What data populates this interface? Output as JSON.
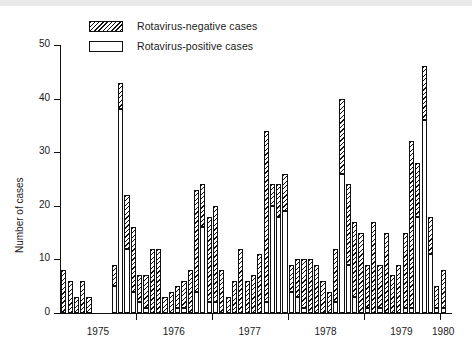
{
  "figure": {
    "ylabel": "Number of cases",
    "y_ticks": [
      "0",
      "10",
      "20",
      "30",
      "40",
      "50"
    ],
    "x_ticks": [
      "1975",
      "1976",
      "1977",
      "1978",
      "1979",
      "1980"
    ],
    "legend": [
      {
        "key": "negative",
        "label": "Rotavirus-negative cases",
        "swatch": "hatched"
      },
      {
        "key": "positive",
        "label": "Rotavirus-positive cases",
        "swatch": "white"
      }
    ],
    "colors": {
      "axis": "#111111",
      "hatch": "#111111",
      "positive_fill": "#ffffff",
      "background": "#ffffff"
    }
  },
  "chart_data": {
    "type": "bar",
    "title": "",
    "subtitle": "",
    "xlabel": "",
    "ylabel": "Number of cases",
    "ylim": [
      0,
      50
    ],
    "ytick_values": [
      0,
      10,
      20,
      30,
      40,
      50
    ],
    "xlim_labels": [
      "1975",
      "1976",
      "1977",
      "1978",
      "1979",
      "1980"
    ],
    "grid": false,
    "stacked": true,
    "legend_position": "top-left",
    "legend_entries": [
      "Rotavirus-negative cases",
      "Rotavirus-positive cases"
    ],
    "x_note": "monthly observations, Jan 1975 through Jan 1980",
    "categories": [
      "1975-01",
      "1975-02",
      "1975-03",
      "1975-04",
      "1975-05",
      "1975-06",
      "1975-07",
      "1975-08",
      "1975-09",
      "1975-10",
      "1975-11",
      "1975-12",
      "1976-01",
      "1976-02",
      "1976-03",
      "1976-04",
      "1976-05",
      "1976-06",
      "1976-07",
      "1976-08",
      "1976-09",
      "1976-10",
      "1976-11",
      "1976-12",
      "1977-01",
      "1977-02",
      "1977-03",
      "1977-04",
      "1977-05",
      "1977-06",
      "1977-07",
      "1977-08",
      "1977-09",
      "1977-10",
      "1977-11",
      "1977-12",
      "1978-01",
      "1978-02",
      "1978-03",
      "1978-04",
      "1978-05",
      "1978-06",
      "1978-07",
      "1978-08",
      "1978-09",
      "1978-10",
      "1978-11",
      "1978-12",
      "1979-01",
      "1979-02",
      "1979-03",
      "1979-04",
      "1979-05",
      "1979-06",
      "1979-07",
      "1979-08",
      "1979-09",
      "1979-10",
      "1979-11",
      "1979-12",
      "1980-01"
    ],
    "series": [
      {
        "name": "Rotavirus-positive cases",
        "values": [
          0,
          0,
          0,
          0,
          0,
          0,
          0,
          0,
          5,
          38,
          12,
          4,
          2,
          1,
          0,
          0,
          0,
          0,
          1,
          1,
          0,
          4,
          16,
          2,
          2,
          0,
          0,
          0,
          0,
          0,
          0,
          0,
          2,
          20,
          18,
          19,
          4,
          3,
          1,
          0,
          0,
          0,
          0,
          2,
          26,
          9,
          3,
          0,
          1,
          0,
          1,
          0,
          0,
          0,
          1,
          1,
          18,
          36,
          11,
          1,
          1
        ]
      },
      {
        "name": "Rotavirus-negative cases",
        "values": [
          8,
          6,
          3,
          6,
          3,
          0,
          0,
          0,
          4,
          5,
          10,
          12,
          5,
          6,
          12,
          12,
          3,
          4,
          4,
          5,
          8,
          19,
          8,
          16,
          18,
          8,
          3,
          6,
          12,
          6,
          7,
          11,
          32,
          4,
          6,
          7,
          5,
          7,
          9,
          10,
          9,
          6,
          4,
          10,
          14,
          15,
          14,
          15,
          8,
          17,
          8,
          15,
          7,
          9,
          14,
          31,
          10,
          10,
          7,
          4,
          7
        ]
      }
    ],
    "totals": [
      8,
      6,
      3,
      6,
      3,
      0,
      0,
      0,
      9,
      43,
      22,
      16,
      7,
      7,
      12,
      12,
      3,
      4,
      5,
      6,
      8,
      23,
      24,
      18,
      20,
      8,
      3,
      6,
      12,
      6,
      7,
      11,
      34,
      24,
      24,
      26,
      9,
      10,
      10,
      10,
      9,
      6,
      4,
      12,
      40,
      24,
      17,
      15,
      9,
      17,
      9,
      15,
      7,
      9,
      15,
      32,
      28,
      46,
      18,
      5,
      8
    ]
  }
}
